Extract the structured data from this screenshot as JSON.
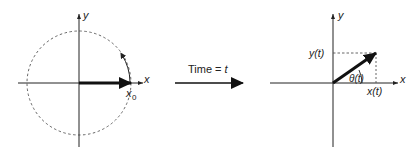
{
  "left_panel": {
    "x_axis_label": "x",
    "y_axis_label": "y",
    "vector_label": "x",
    "vector_label_sub": "0"
  },
  "middle": {
    "arrow_label": "Time = ",
    "arrow_label_var": "t"
  },
  "right_panel": {
    "x_axis_label": "x",
    "y_axis_label": "y",
    "y_projection_label": "y(t)",
    "x_projection_label": "x(t)",
    "angle_label": "θ(t)"
  },
  "colors": {
    "ink": "#222222",
    "dashed": "#555555"
  }
}
